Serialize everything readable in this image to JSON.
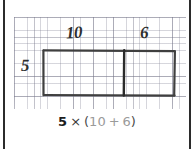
{
  "figure": {
    "kind": "area-model-distributive-property",
    "background_color": "#ffffff",
    "frame_color": "#2b2b2b",
    "grid_color": "#dcdce2",
    "ink_color": "#3a3a3a"
  },
  "grid_paper": {
    "name": "graph-paper",
    "cell_size_px": 6.6,
    "major_cell_size_px": 19.8
  },
  "area_model": {
    "outline_color": "#3f3f3f",
    "divider_color": "#2a2a2a",
    "left_partition_label": "10",
    "right_partition_label": "6",
    "height_label": "5",
    "partitions": [
      {
        "label": "10",
        "width_fraction": 0.612
      },
      {
        "label": "6",
        "width_fraction": 0.388
      }
    ]
  },
  "labels": {
    "top_left_factor": "10",
    "top_right_factor": "6",
    "side_factor": "5"
  },
  "expression": {
    "full_text": "5 × (10 + 6)",
    "multiplier": "5",
    "times_symbol": "×",
    "open_paren": "(",
    "addend_one": "10",
    "plus_symbol": "+",
    "addend_two": "6",
    "close_paren": ")",
    "dim_color": "#9a9a9a",
    "strong_color": "#1d1d1d"
  }
}
